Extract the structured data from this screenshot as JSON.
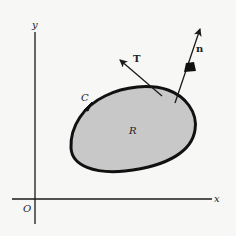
{
  "diagram": {
    "title": "",
    "axes": {
      "x_label": "x",
      "y_label": "y",
      "origin_label": "O"
    },
    "region": {
      "label": "R",
      "fill": "#c8c8c8"
    },
    "curve": {
      "label": "C",
      "orientation": "counterclockwise"
    },
    "vectors": {
      "tangent": {
        "label": "T"
      },
      "normal": {
        "label": "n"
      }
    },
    "colors": {
      "ink": "#1a1a1a",
      "background": "#f7f7f5",
      "region_fill": "#c8c8c8"
    }
  }
}
